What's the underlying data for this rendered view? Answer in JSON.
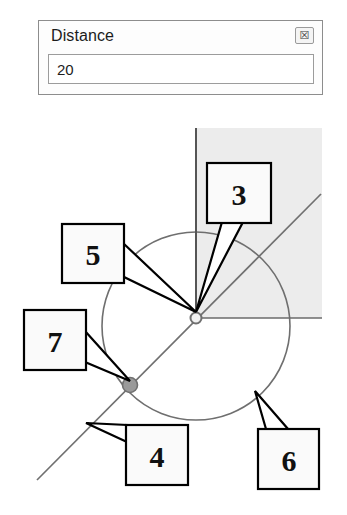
{
  "dialog": {
    "title": "Distance",
    "close_label": "☒",
    "close_icon_name": "close-icon",
    "input_value": "20",
    "input_placeholder": "",
    "border_color": "#8d8d8d",
    "background_color": "#fdfdfd"
  },
  "diagram": {
    "shaded_region_color": "#ececec",
    "line_color": "#6b6b6b",
    "axis_color": "#555555",
    "circle_color": "#6f6f6f",
    "node_fill_color": "#9a9a9a",
    "callouts": [
      {
        "label": "3",
        "box": {
          "x": 207,
          "y": 163,
          "w": 64,
          "h": 60
        }
      },
      {
        "label": "5",
        "box": {
          "x": 62,
          "y": 224,
          "w": 62,
          "h": 59
        }
      },
      {
        "label": "7",
        "box": {
          "x": 24,
          "y": 310,
          "w": 62,
          "h": 60
        }
      },
      {
        "label": "4",
        "box": {
          "x": 126,
          "y": 425,
          "w": 62,
          "h": 60
        }
      },
      {
        "label": "6",
        "box": {
          "x": 258,
          "y": 429,
          "w": 61,
          "h": 60
        }
      }
    ],
    "geometry": {
      "center_node": {
        "x": 196,
        "y": 318
      },
      "circle_node": {
        "x": 130,
        "y": 385
      },
      "circle": {
        "cx": 196,
        "cy": 326,
        "r": 94
      },
      "vertical_axis": {
        "x": 196,
        "y1": 128,
        "y2": 322
      },
      "horizontal_axis": {
        "y": 318,
        "x1": 196,
        "x2": 322
      },
      "diagonal": {
        "x1": 37,
        "y1": 480,
        "x2": 321,
        "y2": 194
      },
      "shaded_rect": {
        "x": 196,
        "y": 128,
        "w": 126,
        "h": 190
      }
    }
  }
}
